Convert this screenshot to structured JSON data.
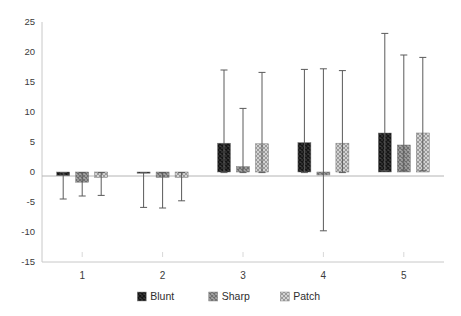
{
  "chart_data": {
    "type": "bar",
    "title": "",
    "subtitle": "",
    "xlabel": "",
    "ylabel": "",
    "categories": [
      "1",
      "2",
      "3",
      "4",
      "5"
    ],
    "ylim": [
      -15,
      25
    ],
    "yticks": [
      25,
      20,
      15,
      10,
      5,
      0,
      -5,
      -10,
      -15
    ],
    "ytick_labels": [
      "25",
      "20",
      "15",
      "10",
      "5",
      "0",
      "-5",
      "-10",
      "-15"
    ],
    "grid": false,
    "legend_position": "bottom",
    "error_bars": true,
    "series": [
      {
        "name": "Blunt",
        "color": "#4a4a4a",
        "pattern": "dark-crosshatch",
        "values": [
          -0.6,
          -0.2,
          4.8,
          4.9,
          6.5
        ],
        "err_upper": [
          -0.1,
          -0.1,
          17.0,
          17.1,
          23.1
        ],
        "err_lower": [
          -4.5,
          -5.9,
          -0.1,
          -0.1,
          0.2
        ]
      },
      {
        "name": "Sharp",
        "color": "#8c8c8c",
        "pattern": "medium-hatch",
        "values": [
          -1.7,
          -0.9,
          0.9,
          -0.5,
          4.5
        ],
        "err_upper": [
          -0.1,
          -0.1,
          10.6,
          17.2,
          19.5
        ],
        "err_lower": [
          -4.0,
          -6.0,
          -0.1,
          -9.8,
          0.2
        ]
      },
      {
        "name": "Patch",
        "color": "#bdbdbd",
        "pattern": "light-crosshatch",
        "values": [
          -0.9,
          -0.9,
          4.7,
          4.8,
          6.5
        ],
        "err_upper": [
          -0.1,
          -0.1,
          16.6,
          16.9,
          19.1
        ],
        "err_lower": [
          -3.9,
          -4.8,
          -0.1,
          -0.1,
          0.2
        ]
      }
    ]
  },
  "axis": {
    "y_tick_labels": [
      "25",
      "20",
      "15",
      "10",
      "5",
      "0",
      "-5",
      "-10",
      "-15"
    ],
    "x_tick_labels": [
      "1",
      "2",
      "3",
      "4",
      "5"
    ]
  },
  "legend": {
    "items": [
      {
        "label": "Blunt"
      },
      {
        "label": "Sharp"
      },
      {
        "label": "Patch"
      }
    ]
  },
  "colors": {
    "blunt": "#4a4a4a",
    "sharp": "#8c8c8c",
    "patch": "#bdbdbd",
    "axis": "#c8c8c8",
    "error": "#5a5a5a",
    "text": "#3b3b3b",
    "background": "#ffffff"
  }
}
